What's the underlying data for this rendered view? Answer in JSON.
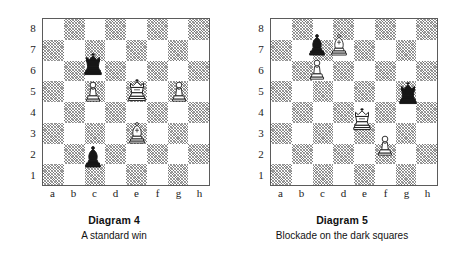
{
  "page": {
    "background": "#ffffff",
    "width": 456,
    "height": 259
  },
  "board_style": {
    "light_square_color": "#ffffff",
    "dark_square_color": "#b9b9b9",
    "border_color": "#5b5b5b",
    "label_color": "#222222"
  },
  "labels": {
    "files": [
      "a",
      "b",
      "c",
      "d",
      "e",
      "f",
      "g",
      "h"
    ],
    "ranks": [
      "8",
      "7",
      "6",
      "5",
      "4",
      "3",
      "2",
      "1"
    ]
  },
  "diagrams": [
    {
      "id": "diagram-4",
      "title": "Diagram 4",
      "subtitle": "A standard win",
      "pieces": [
        {
          "square": "c6",
          "file": "c",
          "rank": 6,
          "color": "black",
          "type": "king",
          "glyph": "♚",
          "name": "black-king"
        },
        {
          "square": "c5",
          "file": "c",
          "rank": 5,
          "color": "white",
          "type": "pawn",
          "glyph": "♙",
          "name": "white-pawn"
        },
        {
          "square": "e5",
          "file": "e",
          "rank": 5,
          "color": "white",
          "type": "king",
          "glyph": "♔",
          "name": "white-king"
        },
        {
          "square": "g5",
          "file": "g",
          "rank": 5,
          "color": "white",
          "type": "pawn",
          "glyph": "♙",
          "name": "white-pawn"
        },
        {
          "square": "e3",
          "file": "e",
          "rank": 3,
          "color": "white",
          "type": "bishop",
          "glyph": "♗",
          "name": "white-bishop"
        },
        {
          "square": "c2",
          "file": "c",
          "rank": 2,
          "color": "black",
          "type": "bishop",
          "glyph": "♝",
          "name": "black-bishop"
        }
      ]
    },
    {
      "id": "diagram-5",
      "title": "Diagram 5",
      "subtitle": "Blockade on the dark squares",
      "pieces": [
        {
          "square": "c7",
          "file": "c",
          "rank": 7,
          "color": "black",
          "type": "bishop",
          "glyph": "♝",
          "name": "black-bishop"
        },
        {
          "square": "d7",
          "file": "d",
          "rank": 7,
          "color": "white",
          "type": "bishop",
          "glyph": "♗",
          "name": "white-bishop"
        },
        {
          "square": "c6",
          "file": "c",
          "rank": 6,
          "color": "white",
          "type": "pawn",
          "glyph": "♙",
          "name": "white-pawn"
        },
        {
          "square": "g5",
          "file": "g",
          "rank": 5,
          "color": "black",
          "type": "king",
          "glyph": "♚",
          "name": "black-king"
        },
        {
          "square": "e4",
          "file": "e",
          "rank": 4,
          "color": "white",
          "type": "king",
          "glyph": "♔",
          "name": "white-king"
        },
        {
          "square": "f3",
          "file": "f",
          "rank": 3,
          "color": "white",
          "type": "pawn",
          "glyph": "♙",
          "name": "white-pawn"
        }
      ]
    }
  ]
}
